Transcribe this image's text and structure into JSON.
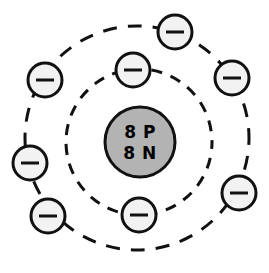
{
  "diagram": {
    "type": "bohr-atom-model",
    "element_name": "Oxygen",
    "background_color": "#ffffff",
    "stroke_color": "#111111",
    "nucleus": {
      "label_line1": "8 P",
      "label_line2": "8 N",
      "proton_count": 8,
      "neutron_count": 8,
      "fill_color": "#b3b3b3",
      "stroke_color": "#111111",
      "center_x": 140,
      "center_y": 142,
      "radius": 35,
      "stroke_width": 3,
      "font_size": 17,
      "line1_y": 138,
      "line2_y": 159
    },
    "electron": {
      "symbol": "minus-sign",
      "fill_color": "#f2f2f2",
      "stroke_color": "#111111",
      "radius": 17,
      "stroke_width": 3,
      "sign_half_width": 9,
      "sign_stroke_width": 3
    },
    "shells": [
      {
        "name": "inner-shell",
        "shell_index": 1,
        "electron_count": 2,
        "radius": 73,
        "center_x": 139,
        "center_y": 142,
        "stroke_width": 3,
        "dash_pattern": "11 9",
        "dash_offset": 4,
        "electrons": [
          {
            "name": "inner-electron-top",
            "cx": 133,
            "cy": 70
          },
          {
            "name": "inner-electron-bottom",
            "cx": 139,
            "cy": 215
          }
        ]
      },
      {
        "name": "outer-shell",
        "shell_index": 2,
        "electron_count": 6,
        "radius": 112,
        "center_x": 137,
        "center_y": 138,
        "stroke_width": 3,
        "dash_pattern": "14 11",
        "dash_offset": 7,
        "electrons": [
          {
            "name": "outer-electron-top",
            "cx": 175,
            "cy": 32
          },
          {
            "name": "outer-electron-upper-left",
            "cx": 45,
            "cy": 80
          },
          {
            "name": "outer-electron-upper-right",
            "cx": 232,
            "cy": 78
          },
          {
            "name": "outer-electron-left",
            "cx": 30,
            "cy": 163
          },
          {
            "name": "outer-electron-lower-left",
            "cx": 48,
            "cy": 216
          },
          {
            "name": "outer-electron-right",
            "cx": 239,
            "cy": 193
          }
        ]
      }
    ]
  }
}
